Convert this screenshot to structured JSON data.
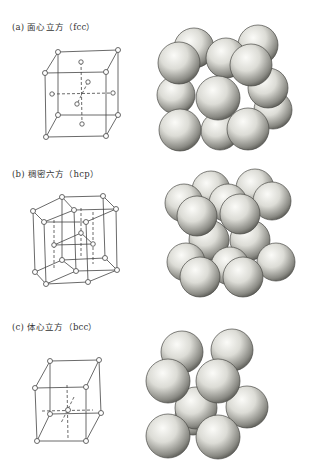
{
  "figure": {
    "panels": [
      {
        "id": "a",
        "label": "(a)  面心立方（fcc）",
        "tag": "(a)",
        "name_cn": "面心立方",
        "abbr": "fcc",
        "lattice_model": "face-centered cubic unit cell",
        "sphere_model": "hard-sphere packing model"
      },
      {
        "id": "b",
        "label": "(b)  稠密六方（hcp）",
        "tag": "(b)",
        "name_cn": "稠密六方",
        "abbr": "hcp",
        "lattice_model": "hexagonal close-packed unit cell",
        "sphere_model": "hard-sphere packing model"
      },
      {
        "id": "c",
        "label": "(c)  体心立方（bcc）",
        "tag": "(c)",
        "name_cn": "体心立方",
        "abbr": "bcc",
        "lattice_model": "body-centered cubic unit cell",
        "sphere_model": "hard-sphere packing model"
      }
    ],
    "colors": {
      "line": "#444444",
      "atom_fill": "#ffffff",
      "sphere_light": "#f4f4f0",
      "sphere_dark": "#6e6e68",
      "text": "#333333"
    }
  }
}
